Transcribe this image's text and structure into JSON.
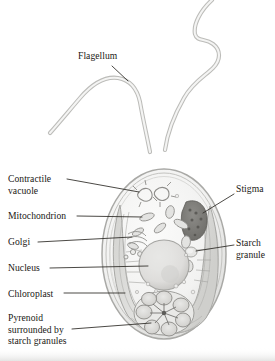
{
  "figure": {
    "style": "grayscale pencil / wash biological illustration",
    "background_color": "#ffffff",
    "ink_color": "#1a1714",
    "line_color": "#2b2824"
  },
  "labels": [
    {
      "id": "flagellum",
      "text": "Flagellum",
      "lines": [
        "Flagellum"
      ],
      "x": 78,
      "y": 50,
      "align": "left",
      "leader": {
        "type": "line",
        "x1": 112,
        "y1": 66,
        "x2": 128,
        "y2": 81
      }
    },
    {
      "id": "contractile-vacuole",
      "text": "Contractile vacuole",
      "lines": [
        "Contractile",
        "vacuole"
      ],
      "x": 8,
      "y": 173,
      "align": "left",
      "leader": {
        "type": "line",
        "x1": 67,
        "y1": 179,
        "x2": 139,
        "y2": 192
      }
    },
    {
      "id": "mitochondrion",
      "text": "Mitochondrion",
      "lines": [
        "Mitochondrion"
      ],
      "x": 8,
      "y": 210,
      "align": "left",
      "leader": {
        "type": "line",
        "x1": 77,
        "y1": 216,
        "x2": 142,
        "y2": 217
      }
    },
    {
      "id": "golgi",
      "text": "Golgi",
      "lines": [
        "Golgi"
      ],
      "x": 8,
      "y": 236,
      "align": "left",
      "leader": {
        "type": "line",
        "x1": 38,
        "y1": 242,
        "x2": 132,
        "y2": 237
      }
    },
    {
      "id": "nucleus",
      "text": "Nucleus",
      "lines": [
        "Nucleus"
      ],
      "x": 8,
      "y": 262,
      "align": "left",
      "leader": {
        "type": "line",
        "x1": 50,
        "y1": 268,
        "x2": 148,
        "y2": 266
      }
    },
    {
      "id": "chloroplast",
      "text": "Chloroplast",
      "lines": [
        "Chloroplast"
      ],
      "x": 8,
      "y": 288,
      "align": "left",
      "leader": {
        "type": "line",
        "x1": 64,
        "y1": 293,
        "x2": 125,
        "y2": 293
      }
    },
    {
      "id": "pyrenoid",
      "text": "Pyrenoid surrounded by starch granules",
      "lines": [
        "Pyrenoid",
        "surrounded by",
        "starch granules"
      ],
      "x": 8,
      "y": 312,
      "align": "left",
      "leader": {
        "type": "line",
        "x1": 72,
        "y1": 329,
        "x2": 151,
        "y2": 323
      }
    },
    {
      "id": "stigma",
      "text": "Stigma",
      "lines": [
        "Stigma"
      ],
      "x": 236,
      "y": 183,
      "align": "left",
      "leader": {
        "type": "line",
        "x1": 234,
        "y1": 194,
        "x2": 203,
        "y2": 213
      }
    },
    {
      "id": "starch-granule",
      "text": "Starch granule",
      "lines": [
        "Starch",
        "granule"
      ],
      "x": 236,
      "y": 237,
      "align": "left",
      "leader": {
        "type": "line",
        "x1": 234,
        "y1": 245,
        "x2": 196,
        "y2": 251
      }
    }
  ],
  "structures": [
    {
      "id": "cell-body",
      "name": "cell body",
      "shape": "ovoid"
    },
    {
      "id": "flagellum-left",
      "name": "left flagellum"
    },
    {
      "id": "flagellum-right",
      "name": "right flagellum"
    },
    {
      "id": "contractile-vacuole-art",
      "name": "contractile vacuole"
    },
    {
      "id": "mitochondria-art",
      "name": "mitochondria"
    },
    {
      "id": "golgi-art",
      "name": "golgi apparatus"
    },
    {
      "id": "nucleus-art",
      "name": "nucleus"
    },
    {
      "id": "chloroplast-art",
      "name": "cup-shaped chloroplast"
    },
    {
      "id": "pyrenoid-art",
      "name": "pyrenoid with starch granules"
    },
    {
      "id": "stigma-art",
      "name": "stigma (eyespot)"
    },
    {
      "id": "starch-granule-art",
      "name": "starch granule"
    }
  ]
}
